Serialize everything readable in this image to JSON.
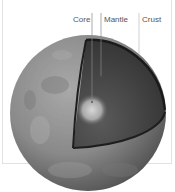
{
  "diagram": {
    "labels": [
      {
        "text": "Core",
        "x": 73,
        "line_x": 92,
        "line_bottom": 102
      },
      {
        "text": "Mantle",
        "x": 104,
        "line_x": 101,
        "line_bottom": 76
      },
      {
        "text": "Crust",
        "x": 142,
        "line_x": 139,
        "line_bottom": 54
      }
    ],
    "colors": {
      "surface": "#8e8e8e",
      "cutaway": "#3c3c3c",
      "core": "#c8c8c8",
      "frame": "#e2e2e2",
      "label_text": "#555555"
    }
  }
}
